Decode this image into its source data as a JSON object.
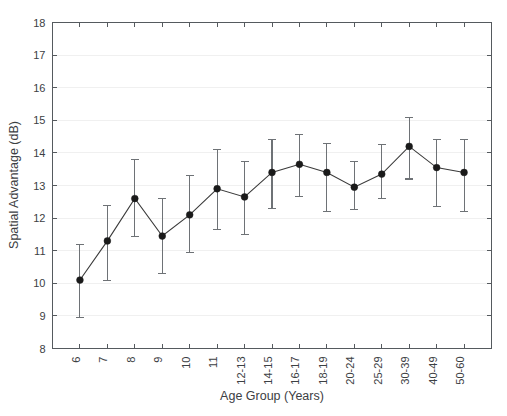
{
  "chart_data": {
    "type": "line",
    "title": "",
    "subtitle": "",
    "xlabel": "Age Group (Years)",
    "ylabel": "Spatial Advantage (dB)",
    "ylim": [
      8,
      18
    ],
    "yticks": [
      8,
      9,
      10,
      11,
      12,
      13,
      14,
      15,
      16,
      17,
      18
    ],
    "ytick_labels": [
      "8",
      "9",
      "10",
      "11",
      "12",
      "13",
      "14",
      "15",
      "16",
      "17",
      "18"
    ],
    "grid": true,
    "legend": null,
    "categories": [
      "6",
      "7",
      "8",
      "9",
      "10",
      "11",
      "12-13",
      "14-15",
      "16-17",
      "18-19",
      "20-24",
      "25-29",
      "30-39",
      "40-49",
      "50-60"
    ],
    "values": [
      10.1,
      11.3,
      12.6,
      11.45,
      12.1,
      12.9,
      12.65,
      13.4,
      13.65,
      13.4,
      12.95,
      13.35,
      14.2,
      13.55,
      13.4
    ],
    "error_upper": [
      11.2,
      12.4,
      13.8,
      12.6,
      13.3,
      14.1,
      13.75,
      14.4,
      14.55,
      14.3,
      13.75,
      14.25,
      15.1,
      14.4,
      14.4
    ],
    "error_lower": [
      8.95,
      10.1,
      11.45,
      10.3,
      10.95,
      11.65,
      11.5,
      12.3,
      12.65,
      12.2,
      12.25,
      12.6,
      13.2,
      12.35,
      12.2
    ],
    "marker": "filled-circle",
    "error_bar_style": "capped-vertical",
    "x_tick_label_rotation": -90,
    "line_color": "#3a3a3a",
    "marker_color": "#1a1a1a",
    "error_color": "#6e7276",
    "grid_color": "#f0f0f0",
    "axis_color": "#555a5e",
    "background_color": "#ffffff"
  }
}
